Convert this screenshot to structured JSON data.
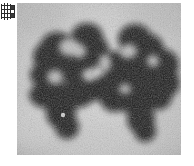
{
  "canvas": {
    "width": 194,
    "height": 166,
    "background": "#ffffff"
  },
  "corner_icon": {
    "name": "grid-table-icon",
    "label": "grid",
    "color": "#2b2b2b",
    "columns": 3,
    "rows": 4
  },
  "micrograph": {
    "title": "",
    "caption": "",
    "x": 17,
    "y": 3,
    "width": 164,
    "height": 152,
    "modality": "grayscale-micrograph",
    "background_color": "#c2c2c2",
    "background_light": "#dcdcdc",
    "background_dark": "#a8a8a8",
    "stain_color": "#0b0b0b",
    "grain": "film-noise",
    "objects": [
      {
        "name": "dark-blob-left",
        "description": "left star-shaped stained mass",
        "center_x": 58,
        "center_y": 74,
        "approx_width": 86,
        "approx_height": 108
      },
      {
        "name": "dark-blob-right",
        "description": "right star-shaped stained mass",
        "center_x": 110,
        "center_y": 80,
        "approx_width": 92,
        "approx_height": 112
      }
    ]
  }
}
